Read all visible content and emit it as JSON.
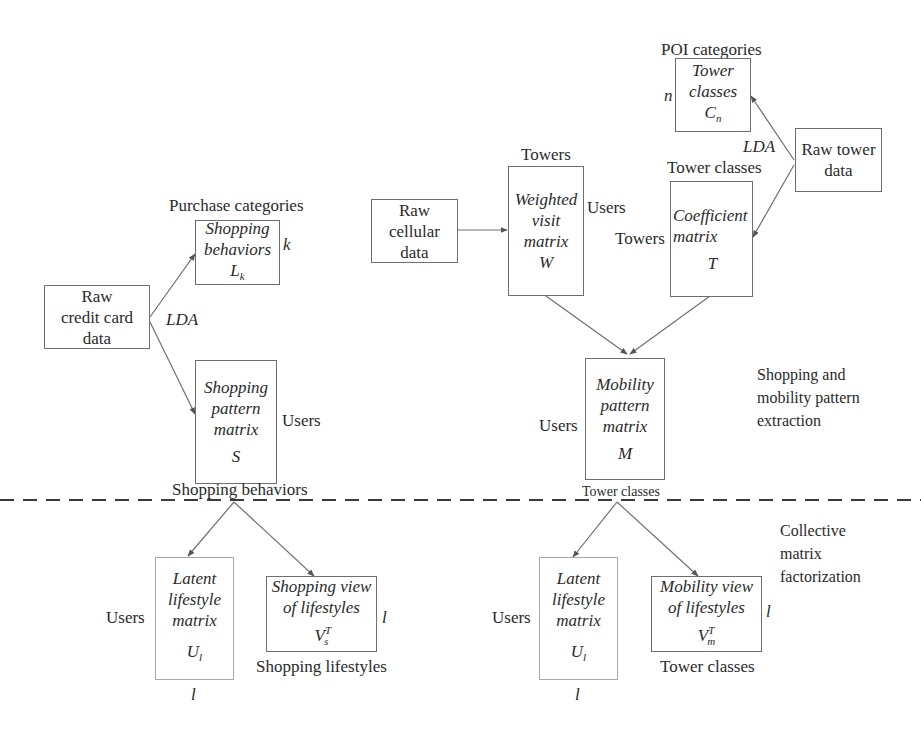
{
  "diagram": {
    "sections": {
      "top_label": "Shopping and mobility pattern extraction",
      "top_label_lines": [
        "Shopping and",
        "mobility pattern",
        "extraction"
      ],
      "bottom_label": "Collective matrix factorization",
      "bottom_label_lines": [
        "Collective",
        "matrix",
        "factorization"
      ]
    },
    "nodes": {
      "raw_credit": {
        "lines": [
          "Raw",
          "credit card",
          "data"
        ]
      },
      "shopping_behaviors": {
        "lines": [
          "Shopping",
          "behaviors"
        ],
        "symbol": "L",
        "sub": "k",
        "top_label": "Purchase categories",
        "right_label": "k"
      },
      "shopping_pattern": {
        "lines": [
          "Shopping",
          "pattern",
          "matrix"
        ],
        "symbol": "S",
        "right_label": "Users",
        "bottom_label": "Shopping behaviors"
      },
      "raw_cellular": {
        "lines": [
          "Raw",
          "cellular",
          "data"
        ]
      },
      "weighted_visit": {
        "lines": [
          "Weighted",
          "visit",
          "matrix"
        ],
        "symbol": "W",
        "top_label": "Towers",
        "right_label": "Users"
      },
      "tower_classes": {
        "lines": [
          "Tower",
          "classes"
        ],
        "symbol": "C",
        "sub": "n",
        "top_label": "POI categories",
        "left_label": "n"
      },
      "raw_tower": {
        "lines": [
          "Raw tower",
          "data"
        ]
      },
      "coefficient": {
        "lines": [
          "Coefficient",
          "matrix"
        ],
        "symbol": "T",
        "top_label": "Tower classes",
        "left_label": "Towers"
      },
      "mobility_pattern": {
        "lines": [
          "Mobility",
          "pattern",
          "matrix"
        ],
        "symbol": "M",
        "left_label": "Users",
        "bottom_label": "Tower classes"
      },
      "latent_left": {
        "lines": [
          "Latent",
          "lifestyle",
          "matrix"
        ],
        "symbol": "U",
        "sub": "l",
        "left_label": "Users",
        "bottom_label": "l"
      },
      "shopping_view": {
        "lines": [
          "Shopping view",
          "of lifestyles"
        ],
        "symbol": "V",
        "sup": "T",
        "sub": "s",
        "right_label": "l",
        "bottom_label": "Shopping lifestyles"
      },
      "latent_right": {
        "lines": [
          "Latent",
          "lifestyle",
          "matrix"
        ],
        "symbol": "U",
        "sub": "l",
        "left_label": "Users",
        "bottom_label": "l"
      },
      "mobility_view": {
        "lines": [
          "Mobility view",
          "of lifestyles"
        ],
        "symbol": "V",
        "sup": "T",
        "sub": "m",
        "right_label": "l",
        "bottom_label": "Tower classes"
      }
    },
    "edge_labels": {
      "lda_credit": "LDA",
      "lda_tower": "LDA"
    },
    "colors": {
      "line": "#6e6e6e",
      "dashed_divider": "#3a3a3a",
      "text": "#2a2a2a"
    }
  }
}
